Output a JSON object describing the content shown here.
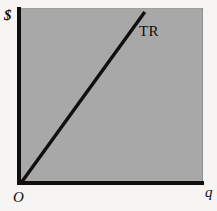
{
  "figure": {
    "background_color": "#f6f5f3",
    "plot_fill_color": "#a8a8a8",
    "axis_color": "#100f0d",
    "curve_color": "#100f0d"
  },
  "labels": {
    "y_axis": "$",
    "x_axis": "q",
    "origin": "O",
    "curve": "TR"
  },
  "chart_data": {
    "type": "line",
    "title": "",
    "subtitle": "",
    "xlabel": "q",
    "ylabel": "$",
    "grid": false,
    "legend_position": "inline-right-of-line",
    "annotations": [
      {
        "text": "TR",
        "x": 0.69,
        "y": 0.92
      },
      {
        "text": "O",
        "x": 0.0,
        "y": 0.0
      }
    ],
    "xlim": [
      0,
      1
    ],
    "ylim": [
      0,
      1
    ],
    "axis_tick_labels": {
      "x": [],
      "y": []
    },
    "series": [
      {
        "name": "TR",
        "description": "Total revenue rises linearly from the origin",
        "x": [
          0.0,
          0.68
        ],
        "y": [
          0.0,
          0.977
        ]
      }
    ]
  }
}
